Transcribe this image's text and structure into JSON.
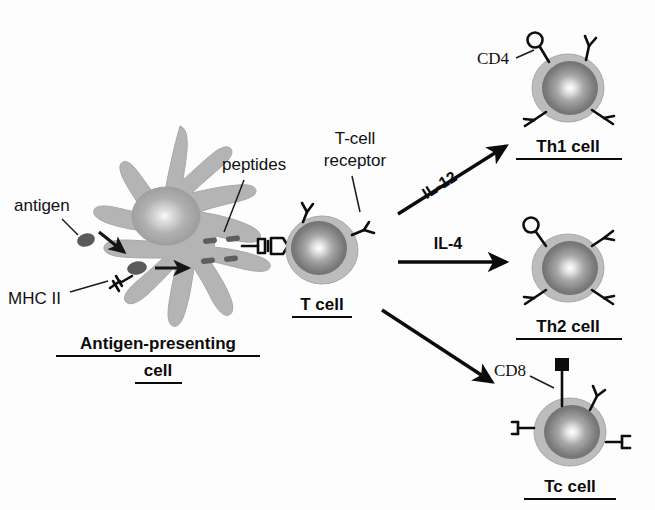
{
  "figure": {
    "background_color": "#fdfdfd"
  },
  "colors": {
    "cell_membrane": "#bcbcbc",
    "cell_membrane_edge": "#a3a3a3",
    "nucleus_dark": "#6e6e6e",
    "nucleus_highlight": "#ffffff",
    "apc_body": "#b4b4b4",
    "apc_nucleus": "#9a9a9a",
    "antigen": "#5a5a5a",
    "peptide": "#5e5e5e",
    "outline": "#0b0b0b",
    "text": "#111111"
  },
  "labels": {
    "antigen": "antigen",
    "mhc_ii": "MHC II",
    "peptides": "peptides",
    "tcr_line1": "T-cell",
    "tcr_line2": "receptor",
    "cd4": "CD4",
    "cd8": "CD8"
  },
  "cells": [
    {
      "id": "apc",
      "name": "Antigen-presenting cell",
      "caption_line1": "Antigen-presenting",
      "caption_line2": "cell",
      "caption_bold": true,
      "caption_underlined": true,
      "shape": "dendritic",
      "cx": 168,
      "cy": 245
    },
    {
      "id": "t-cell",
      "name": "T cell",
      "caption_line1": "T cell",
      "caption_line2": "",
      "caption_bold": true,
      "caption_underlined": true,
      "shape": "round",
      "cx": 322,
      "cy": 250,
      "markers": [],
      "receptors": 3
    },
    {
      "id": "th1-cell",
      "name": "Th1 cell",
      "caption_line1": "Th1 cell",
      "caption_line2": "",
      "caption_bold": true,
      "caption_underlined": true,
      "shape": "round",
      "cx": 568,
      "cy": 88,
      "markers": [
        "CD4"
      ],
      "marker_glyph": "circle",
      "receptors": 3
    },
    {
      "id": "th2-cell",
      "name": "Th2 cell",
      "caption_line1": "Th2 cell",
      "caption_line2": "",
      "caption_bold": true,
      "caption_underlined": true,
      "shape": "round",
      "cx": 568,
      "cy": 268,
      "markers": [
        "CD4"
      ],
      "marker_glyph": "circle",
      "receptors": 3
    },
    {
      "id": "tc-cell",
      "name": "Tc cell",
      "caption_line1": "Tc cell",
      "caption_line2": "",
      "caption_bold": true,
      "caption_underlined": true,
      "shape": "round",
      "cx": 570,
      "cy": 432,
      "markers": [
        "CD8"
      ],
      "marker_glyph": "square",
      "receptors": 3
    }
  ],
  "arrows": [
    {
      "id": "il12-arrow",
      "label": "IL-12",
      "from": "T cell",
      "to": "Th1 cell",
      "direction": "up-right",
      "x1": 398,
      "y1": 212,
      "x2": 508,
      "y2": 145,
      "label_rotation": -31
    },
    {
      "id": "il4-arrow",
      "label": "IL-4",
      "from": "T cell",
      "to": "Th2 cell",
      "direction": "right",
      "x1": 398,
      "y1": 262,
      "x2": 508,
      "y2": 262,
      "label_rotation": 0
    },
    {
      "id": "tc-arrow",
      "label": "",
      "from": "T cell",
      "to": "Tc cell",
      "direction": "down-right",
      "x1": 382,
      "y1": 310,
      "x2": 492,
      "y2": 382,
      "label_rotation": 0
    },
    {
      "id": "antigen-uptake-arrow",
      "label": "",
      "from": "antigen",
      "to": "antigen-presenting cell",
      "direction": "down-right",
      "x1": 99,
      "y1": 232,
      "x2": 126,
      "y2": 253
    },
    {
      "id": "processing-arrow",
      "label": "",
      "from": "internalized antigen",
      "to": "peptides",
      "direction": "right",
      "x1": 152,
      "y1": 268,
      "x2": 190,
      "y2": 268
    }
  ],
  "annotations": [
    {
      "id": "antigen-label",
      "text": "antigen",
      "x": 14,
      "y": 207,
      "anchor": "start",
      "font": "sans"
    },
    {
      "id": "mhc-label",
      "text": "MHC II",
      "x": 8,
      "y": 300,
      "anchor": "start",
      "font": "sans"
    },
    {
      "id": "peptides-label",
      "text": "peptides",
      "x": 222,
      "y": 166,
      "anchor": "start",
      "font": "sans"
    },
    {
      "id": "tcr-label-1",
      "text": "T-cell",
      "x": 355,
      "y": 140,
      "anchor": "middle",
      "font": "sans"
    },
    {
      "id": "tcr-label-2",
      "text": "receptor",
      "x": 355,
      "y": 162,
      "anchor": "middle",
      "font": "sans"
    },
    {
      "id": "cd4-label",
      "text": "CD4",
      "x": 477,
      "y": 60,
      "anchor": "start",
      "font": "serif"
    },
    {
      "id": "cd8-label",
      "text": "CD8",
      "x": 494,
      "y": 372,
      "anchor": "start",
      "font": "serif"
    }
  ]
}
